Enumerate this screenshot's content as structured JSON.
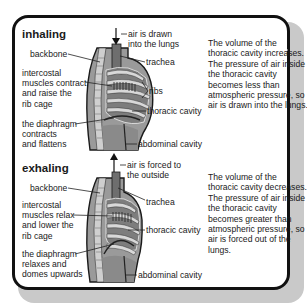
{
  "sections": [
    {
      "title": "inhaling",
      "labels_left": {
        "backbone": "backbone",
        "muscles": "intercostal\nmuscles contract\nand raise the\nrib cage",
        "diaphragm": "the diaphragm\ncontracts\nand flattens"
      },
      "labels_right": {
        "air": "air is drawn\ninto the lungs",
        "trachea": "trachea",
        "ribs": "ribs",
        "thoracic": "thoracic cavity",
        "abdominal": "abdominal cavity"
      },
      "description": "The volume of the thoracic cavity increases. The pressure of air inside the thoracic cavity becomes less than atmospheric pressure, so air is drawn into the lungs."
    },
    {
      "title": "exhaling",
      "labels_left": {
        "backbone": "backbone",
        "muscles": "intercostal\nmuscles relax\nand lower the\nrib cage",
        "diaphragm": "the diaphragm\nrelaxes and\ndomes upwards"
      },
      "labels_right": {
        "air": "air is forced to\nthe outside",
        "trachea": "trachea",
        "thoracic": "thoracic cavity",
        "abdominal": "abdominal cavity"
      },
      "description": "The volume of the thoracic cavity decreases. The pressure of air inside the thoracic cavity becomes greater than atmospheric pressure, so air is forced out of the lungs."
    }
  ],
  "colors": {
    "body_fill": "#9a9a9a",
    "cavity_fill": "#7d7d7d",
    "rib_fill": "#d8d8d8",
    "spine_fill": "#cfcfcf",
    "outline": "#1a1a1a",
    "shadow": "#c9c9c9"
  }
}
